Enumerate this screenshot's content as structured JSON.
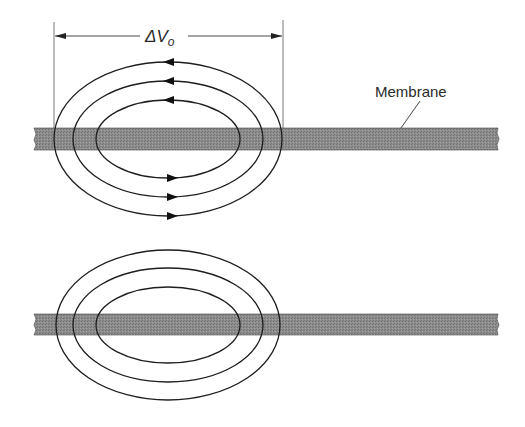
{
  "diagram": {
    "dimension": {
      "label_delta": "ΔV",
      "label_subscript": "o",
      "x_left": 54,
      "x_right": 282,
      "y": 36
    },
    "membrane_label": "Membrane",
    "colors": {
      "membrane_fill": "#8a8a8a",
      "line": "#2a2a2a",
      "background": "#ffffff"
    },
    "panels": [
      {
        "name": "top",
        "membrane_y": 128,
        "membrane_height": 22,
        "center": [
          168,
          139
        ],
        "loops": [
          {
            "rx": 114,
            "ry": 77
          },
          {
            "rx": 95,
            "ry": 58
          },
          {
            "rx": 72,
            "ry": 39
          }
        ],
        "arrows": "top-left, bottom-right (clockwise flow reversed: counter-clockwise)"
      },
      {
        "name": "bottom",
        "membrane_y": 314,
        "membrane_height": 21,
        "center": [
          168,
          325
        ],
        "loops": [
          {
            "rx": 112,
            "ry": 75
          },
          {
            "rx": 95,
            "ry": 57
          },
          {
            "rx": 72,
            "ry": 38
          }
        ],
        "arrows": "none"
      }
    ]
  }
}
